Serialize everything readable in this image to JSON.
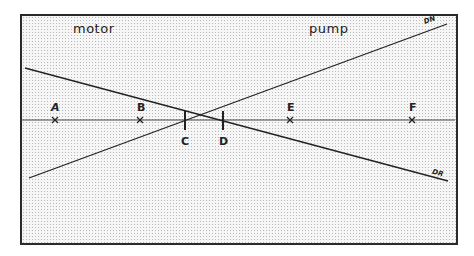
{
  "regions": {
    "left": "motor",
    "right": "pump"
  },
  "lines": {
    "ascending": {
      "label": "DN",
      "x1": 29,
      "y1": 178,
      "x2": 447,
      "y2": 24
    },
    "descending": {
      "label": "DR",
      "x1": 25,
      "y1": 68,
      "x2": 448,
      "y2": 181
    }
  },
  "axis": {
    "y": 120,
    "x1": 20,
    "x2": 456
  },
  "points": [
    {
      "label": "A",
      "x": 55,
      "marker": "cross"
    },
    {
      "label": "B",
      "x": 140,
      "marker": "cross"
    },
    {
      "label": "C",
      "x": 185,
      "marker": "tick"
    },
    {
      "label": "D",
      "x": 223,
      "marker": "tick"
    },
    {
      "label": "E",
      "x": 290,
      "marker": "cross"
    },
    {
      "label": "F",
      "x": 412,
      "marker": "cross"
    }
  ],
  "colors": {
    "ink": "#222222",
    "grid_dot": "#b8b8b8",
    "background": "#f6f6f6"
  }
}
